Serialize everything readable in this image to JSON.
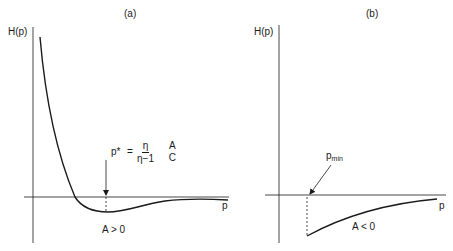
{
  "panels": [
    {
      "id": "a",
      "title": "(a)",
      "y_label": "H(p)",
      "x_label": "p",
      "condition": "A > 0",
      "annotation": {
        "symbol": "p*",
        "equals": "=",
        "frac1_num": "η",
        "frac1_den": "η−1",
        "frac2_num": "A",
        "frac2_den": "C",
        "text": "p* = η/(η−1) · A/C"
      }
    },
    {
      "id": "b",
      "title": "(b)",
      "y_label": "H(p)",
      "x_label": "p",
      "condition": "A < 0",
      "annotation": {
        "symbol": "p",
        "subscript": "min",
        "text": "p_min"
      }
    }
  ],
  "colors": {
    "ink": "#1a1a1a",
    "background": "#ffffff"
  }
}
